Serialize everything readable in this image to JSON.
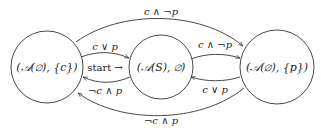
{
  "diagram": {
    "type": "state-machine",
    "states": [
      {
        "id": "left",
        "label": "(𝒜(∅), {c})"
      },
      {
        "id": "middle",
        "label": "(𝒜(S), ∅)",
        "initial": true,
        "initial_marker": "start →"
      },
      {
        "id": "right",
        "label": "(𝒜(∅), {p})"
      }
    ],
    "transitions": [
      {
        "from": "left",
        "to": "middle",
        "label": "c ∨ p"
      },
      {
        "from": "middle",
        "to": "left",
        "label": "¬c ∧ p"
      },
      {
        "from": "middle",
        "to": "right",
        "label": "c ∧ ¬p"
      },
      {
        "from": "right",
        "to": "middle",
        "label": "c ∨ p"
      },
      {
        "from": "left",
        "to": "right",
        "label": "c ∧ ¬p"
      },
      {
        "from": "right",
        "to": "left",
        "label": "¬c ∧ p"
      }
    ],
    "colors": {
      "stroke": "#333333",
      "text": "#222222",
      "background": "#ffffff"
    }
  }
}
